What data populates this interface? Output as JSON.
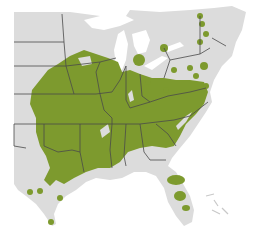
{
  "map": {
    "type": "species-range-map",
    "region": "Eastern United States",
    "colors": {
      "background": "#ffffff",
      "land": "#dcdcdc",
      "range": "#7d9a2e",
      "range_dark": "#6f8a27",
      "border": "#4a4a4a",
      "water": "#ffffff"
    },
    "legend": []
  }
}
